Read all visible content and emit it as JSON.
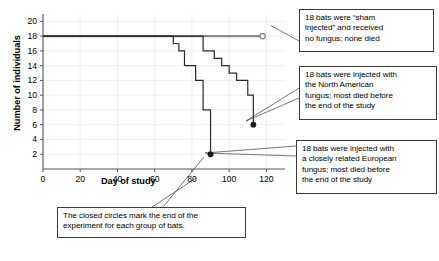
{
  "chart_data": {
    "type": "line",
    "title": "",
    "xlabel": "Day of study",
    "ylabel": "Number of individuals",
    "xlim": [
      0,
      130
    ],
    "ylim": [
      0,
      21
    ],
    "xticks": [
      0,
      20,
      40,
      60,
      80,
      100,
      120
    ],
    "yticks": [
      2,
      4,
      6,
      8,
      10,
      12,
      14,
      16,
      18,
      20
    ],
    "grid": true,
    "legend_position": "callout-annotations",
    "series": [
      {
        "name": "Sham injected (no fungus)",
        "color": "#8c8c8c",
        "end_marker": "open-circle",
        "end_point": [
          118,
          18
        ],
        "points": [
          [
            0,
            18
          ],
          [
            118,
            18
          ]
        ]
      },
      {
        "name": "Closely related European fungus",
        "color": "#2a2a2a",
        "end_marker": "closed-circle",
        "end_point": [
          90,
          2
        ],
        "points": [
          [
            0,
            18
          ],
          [
            70,
            18
          ],
          [
            70,
            17
          ],
          [
            73,
            17
          ],
          [
            73,
            16
          ],
          [
            76,
            16
          ],
          [
            76,
            14
          ],
          [
            82,
            14
          ],
          [
            82,
            12
          ],
          [
            86,
            12
          ],
          [
            86,
            8
          ],
          [
            90,
            8
          ],
          [
            90,
            2
          ]
        ]
      },
      {
        "name": "North American fungus",
        "color": "#2a2a2a",
        "end_marker": "closed-circle",
        "end_point": [
          113,
          6
        ],
        "points": [
          [
            0,
            18
          ],
          [
            86,
            18
          ],
          [
            86,
            16
          ],
          [
            92,
            16
          ],
          [
            92,
            15
          ],
          [
            96,
            15
          ],
          [
            96,
            14
          ],
          [
            100,
            14
          ],
          [
            100,
            13
          ],
          [
            104,
            13
          ],
          [
            104,
            12
          ],
          [
            110,
            12
          ],
          [
            110,
            10
          ],
          [
            113,
            10
          ],
          [
            113,
            6
          ]
        ]
      }
    ]
  },
  "annotations": {
    "sham": {
      "lines": [
        "18 bats were “sham",
        "injected” and received",
        "no fungus; none died"
      ]
    },
    "north_american": {
      "lines": [
        "18 bats were injected with",
        "the North American",
        "fungus; most died before",
        "the end of the study"
      ]
    },
    "european": {
      "lines": [
        "18 bats were injected with",
        "a closely related European",
        "fungus; most died before",
        "the end of the study"
      ]
    },
    "closed_circles": {
      "lines": [
        "The closed circles mark the end of the",
        "experiment for each group of bats."
      ]
    }
  },
  "axis": {
    "x_title": "Day of study",
    "y_title": "Number of individuals",
    "x_tick_labels": [
      "0",
      "20",
      "40",
      "60",
      "80",
      "100",
      "120"
    ],
    "y_tick_labels": [
      "2",
      "4",
      "6",
      "8",
      "10",
      "12",
      "14",
      "16",
      "18",
      "20"
    ]
  },
  "colors": {
    "sham_line": "#8c8c8c",
    "curve_line": "#2a2a2a",
    "axis": "#555555",
    "grid": "#e8e8e8",
    "box_border": "#3a3a3a"
  }
}
